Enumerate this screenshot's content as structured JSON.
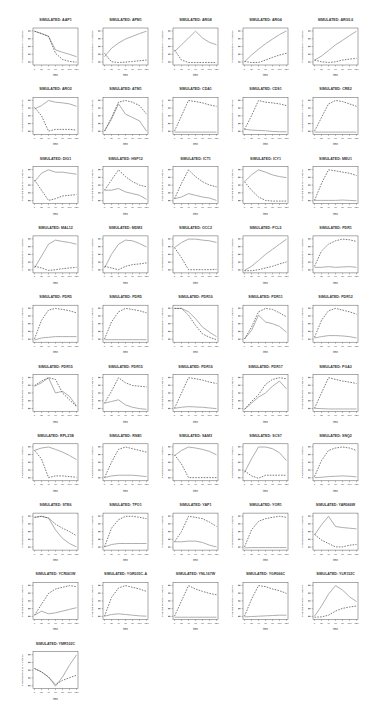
{
  "figure": {
    "columns": 5,
    "panel_pitch_x": 70,
    "panel_pitch_y": 69.3,
    "origin_x": 33,
    "origin_title_y": 21,
    "box_width": 45,
    "box_top_offset": 7,
    "box_height": 37,
    "line_color": "#999999",
    "dash_color": "#444444",
    "axis_color": "#555555"
  },
  "chart_data": {
    "type": "line",
    "title": "",
    "xlabel": "time",
    "ylabel": "Predicted Relative Abundance",
    "x": [
      0,
      20,
      40,
      60,
      80,
      100,
      120
    ],
    "x_tick_labels": [
      "0",
      "20",
      "40",
      "60",
      "80",
      "100",
      "120"
    ],
    "legend": {
      "solid": "series 1 (solid)",
      "dashed": "series 2 (dashed)"
    },
    "grid": false,
    "panels": [
      {
        "title": "SIMULATED: AAP1",
        "solid": [
          0.95,
          0.88,
          0.8,
          0.4,
          0.33,
          0.27,
          0.2
        ],
        "dashed": [
          0.95,
          0.88,
          0.8,
          0.3,
          0.12,
          0.06,
          0.04
        ]
      },
      {
        "title": "SIMULATED: APM1",
        "solid": [
          0.2,
          0.45,
          0.6,
          0.72,
          0.8,
          0.88,
          0.95
        ],
        "dashed": [
          0.3,
          0.05,
          0.03,
          0.04,
          0.06,
          0.08,
          0.1
        ]
      },
      {
        "title": "SIMULATED: ARG8",
        "solid": [
          0.35,
          0.55,
          0.75,
          0.95,
          0.75,
          0.62,
          0.55
        ],
        "dashed": [
          0.4,
          0.1,
          0.03,
          0.03,
          0.03,
          0.03,
          0.03
        ]
      },
      {
        "title": "SIMULATED: ARG4",
        "solid": [
          0.05,
          0.25,
          0.42,
          0.58,
          0.72,
          0.85,
          0.96
        ],
        "dashed": [
          0.06,
          0.03,
          0.03,
          0.1,
          0.18,
          0.25,
          0.3
        ]
      },
      {
        "title": "SIMULATED: ARG5,6",
        "solid": [
          0.1,
          0.22,
          0.38,
          0.55,
          0.68,
          0.82,
          0.95
        ],
        "dashed": [
          0.1,
          0.05,
          0.03,
          0.05,
          0.1,
          0.13,
          0.15
        ]
      },
      {
        "title": "SIMULATED: ARO2",
        "solid": [
          0.7,
          0.8,
          0.95,
          0.9,
          0.88,
          0.85,
          0.78
        ],
        "dashed": [
          0.75,
          0.5,
          0.05,
          0.1,
          0.1,
          0.1,
          0.08
        ]
      },
      {
        "title": "SIMULATED: ATM1",
        "solid": [
          0.05,
          0.4,
          0.85,
          0.55,
          0.45,
          0.35,
          0.05
        ],
        "dashed": [
          0.05,
          0.45,
          0.9,
          0.95,
          0.9,
          0.8,
          0.55
        ]
      },
      {
        "title": "SIMULATED: CDA1",
        "solid": [
          0.02,
          0.02,
          0.02,
          0.02,
          0.02,
          0.02,
          0.02
        ],
        "dashed": [
          0.05,
          0.5,
          0.95,
          0.92,
          0.88,
          0.82,
          0.78
        ]
      },
      {
        "title": "SIMULATED: CDS1",
        "solid": [
          0.1,
          0.08,
          0.07,
          0.06,
          0.04,
          0.03,
          0.03
        ],
        "dashed": [
          0.1,
          0.5,
          0.95,
          0.9,
          0.88,
          0.85,
          0.8
        ]
      },
      {
        "title": "SIMULATED: CRE2",
        "solid": [
          0.02,
          0.02,
          0.02,
          0.02,
          0.02,
          0.02,
          0.02
        ],
        "dashed": [
          0.05,
          0.45,
          0.85,
          0.95,
          0.92,
          0.85,
          0.78
        ]
      },
      {
        "title": "SIMULATED: DIG1",
        "solid": [
          0.6,
          0.85,
          0.95,
          0.88,
          0.88,
          0.85,
          0.82
        ],
        "dashed": [
          0.65,
          0.35,
          0.05,
          0.1,
          0.18,
          0.2,
          0.22
        ]
      },
      {
        "title": "SIMULATED: HSP12",
        "solid": [
          0.35,
          0.35,
          0.4,
          0.3,
          0.25,
          0.2,
          0.08
        ],
        "dashed": [
          0.35,
          0.65,
          0.95,
          0.75,
          0.6,
          0.5,
          0.45
        ]
      },
      {
        "title": "SIMULATED: ICT1",
        "solid": [
          0.1,
          0.15,
          0.25,
          0.2,
          0.15,
          0.12,
          0.05
        ],
        "dashed": [
          0.1,
          0.55,
          0.95,
          0.75,
          0.6,
          0.5,
          0.45
        ]
      },
      {
        "title": "SIMULATED: ICY1",
        "solid": [
          0.6,
          0.8,
          0.95,
          0.88,
          0.8,
          0.75,
          0.72
        ],
        "dashed": [
          0.6,
          0.35,
          0.15,
          0.05,
          0.03,
          0.03,
          0.03
        ]
      },
      {
        "title": "SIMULATED: MEU1",
        "solid": [
          0.05,
          0.05,
          0.05,
          0.05,
          0.06,
          0.05,
          0.04
        ],
        "dashed": [
          0.05,
          0.55,
          0.95,
          0.92,
          0.88,
          0.85,
          0.78
        ]
      },
      {
        "title": "SIMULATED: MAL12",
        "solid": [
          0.1,
          0.45,
          0.8,
          0.92,
          0.88,
          0.85,
          0.8
        ],
        "dashed": [
          0.15,
          0.1,
          0.03,
          0.05,
          0.08,
          0.1,
          0.12
        ]
      },
      {
        "title": "SIMULATED: MDM3",
        "solid": [
          0.1,
          0.5,
          0.8,
          0.92,
          0.9,
          0.82,
          0.72
        ],
        "dashed": [
          0.15,
          0.1,
          0.05,
          0.15,
          0.2,
          0.22,
          0.25
        ]
      },
      {
        "title": "SIMULATED: OCC2",
        "solid": [
          0.7,
          0.85,
          0.95,
          0.95,
          0.92,
          0.9,
          0.85
        ],
        "dashed": [
          0.7,
          0.4,
          0.05,
          0.05,
          0.05,
          0.05,
          0.06
        ]
      },
      {
        "title": "SIMULATED: PCL5",
        "solid": [
          0.03,
          0.15,
          0.32,
          0.5,
          0.65,
          0.8,
          0.95
        ],
        "dashed": [
          0.02,
          0.02,
          0.05,
          0.1,
          0.15,
          0.22,
          0.28
        ]
      },
      {
        "title": "SIMULATED: PDR1",
        "solid": [
          0.12,
          0.12,
          0.14,
          0.12,
          0.13,
          0.14,
          0.12
        ],
        "dashed": [
          0.15,
          0.6,
          0.8,
          0.9,
          0.95,
          0.93,
          0.88
        ]
      },
      {
        "title": "SIMULATED: PDR5",
        "solid": [
          0.02,
          0.08,
          0.1,
          0.12,
          0.12,
          0.12,
          0.12
        ],
        "dashed": [
          0.05,
          0.6,
          0.9,
          0.95,
          0.92,
          0.88,
          0.82
        ]
      },
      {
        "title": "SIMULATED: PDR5",
        "solid": [
          0.03,
          0.03,
          0.03,
          0.03,
          0.03,
          0.03,
          0.03
        ],
        "dashed": [
          0.05,
          0.55,
          0.85,
          0.95,
          0.92,
          0.88,
          0.82
        ]
      },
      {
        "title": "SIMULATED: PDR10",
        "solid": [
          0.95,
          0.95,
          0.85,
          0.65,
          0.4,
          0.25,
          0.12
        ],
        "dashed": [
          0.95,
          0.95,
          0.75,
          0.45,
          0.2,
          0.1,
          0.03
        ]
      },
      {
        "title": "SIMULATED: PDR11",
        "solid": [
          0.05,
          0.3,
          0.75,
          0.55,
          0.5,
          0.42,
          0.25
        ],
        "dashed": [
          0.05,
          0.4,
          0.85,
          0.95,
          0.92,
          0.82,
          0.7
        ]
      },
      {
        "title": "SIMULATED: PDR12",
        "solid": [
          0.08,
          0.12,
          0.15,
          0.15,
          0.14,
          0.12,
          0.08
        ],
        "dashed": [
          0.1,
          0.6,
          0.88,
          0.95,
          0.9,
          0.85,
          0.78
        ]
      },
      {
        "title": "SIMULATED: PDR15",
        "solid": [
          0.7,
          0.8,
          0.95,
          0.5,
          0.55,
          0.4,
          0.12
        ],
        "dashed": [
          0.72,
          0.85,
          0.95,
          0.9,
          0.5,
          0.3,
          0.1
        ]
      },
      {
        "title": "SIMULATED: PDR15",
        "solid": [
          0.2,
          0.25,
          0.3,
          0.15,
          0.08,
          0.04,
          0.02
        ],
        "dashed": [
          0.2,
          0.55,
          0.95,
          0.8,
          0.72,
          0.7,
          0.68
        ]
      },
      {
        "title": "SIMULATED: PDR16",
        "solid": [
          0.05,
          0.08,
          0.1,
          0.09,
          0.08,
          0.06,
          0.04
        ],
        "dashed": [
          0.05,
          0.5,
          0.95,
          0.92,
          0.88,
          0.82,
          0.78
        ]
      },
      {
        "title": "SIMULATED: PDR17",
        "solid": [
          0.02,
          0.2,
          0.38,
          0.5,
          0.7,
          0.85,
          0.62
        ],
        "dashed": [
          0.02,
          0.25,
          0.45,
          0.75,
          0.9,
          0.95,
          0.92
        ]
      },
      {
        "title": "SIMULATED: PGA3",
        "solid": [
          0.05,
          0.04,
          0.03,
          0.03,
          0.03,
          0.03,
          0.03
        ],
        "dashed": [
          0.05,
          0.5,
          0.95,
          0.9,
          0.85,
          0.82,
          0.78
        ]
      },
      {
        "title": "SIMULATED: RPL21B",
        "solid": [
          0.85,
          0.92,
          0.95,
          0.88,
          0.8,
          0.7,
          0.58
        ],
        "dashed": [
          0.85,
          0.6,
          0.05,
          0.1,
          0.1,
          0.08,
          0.06
        ]
      },
      {
        "title": "SIMULATED: RSB1",
        "solid": [
          0.05,
          0.1,
          0.12,
          0.12,
          0.12,
          0.1,
          0.08
        ],
        "dashed": [
          0.05,
          0.5,
          0.88,
          0.95,
          0.9,
          0.85,
          0.8
        ]
      },
      {
        "title": "SIMULATED: SAM3",
        "solid": [
          0.7,
          0.85,
          0.95,
          0.92,
          0.88,
          0.82,
          0.72
        ],
        "dashed": [
          0.72,
          0.45,
          0.05,
          0.05,
          0.05,
          0.05,
          0.05
        ]
      },
      {
        "title": "SIMULATED: SCS7",
        "solid": [
          0.2,
          0.6,
          0.95,
          0.95,
          0.9,
          0.78,
          0.55
        ],
        "dashed": [
          0.25,
          0.1,
          0.03,
          0.12,
          0.12,
          0.12,
          0.12
        ]
      },
      {
        "title": "SIMULATED: SNQ2",
        "solid": [
          0.05,
          0.06,
          0.08,
          0.09,
          0.1,
          0.09,
          0.07
        ],
        "dashed": [
          0.08,
          0.55,
          0.85,
          0.92,
          0.95,
          0.92,
          0.85
        ]
      },
      {
        "title": "SIMULATED: STE6",
        "solid": [
          0.92,
          0.95,
          0.9,
          0.55,
          0.3,
          0.15,
          0.05
        ],
        "dashed": [
          0.92,
          0.95,
          0.9,
          0.72,
          0.6,
          0.5,
          0.38
        ]
      },
      {
        "title": "SIMULATED: TPO1",
        "solid": [
          0.05,
          0.12,
          0.15,
          0.15,
          0.15,
          0.15,
          0.15
        ],
        "dashed": [
          0.05,
          0.6,
          0.85,
          0.95,
          0.95,
          0.92,
          0.88
        ]
      },
      {
        "title": "SIMULATED: YAP1",
        "solid": [
          0.2,
          0.2,
          0.22,
          0.22,
          0.18,
          0.1,
          0.05
        ],
        "dashed": [
          0.2,
          0.5,
          0.95,
          0.92,
          0.88,
          0.78,
          0.65
        ]
      },
      {
        "title": "SIMULATED: YOR1",
        "solid": [
          0.02,
          0.03,
          0.03,
          0.03,
          0.03,
          0.03,
          0.03
        ],
        "dashed": [
          0.05,
          0.55,
          0.8,
          0.88,
          0.92,
          0.95,
          0.92
        ]
      },
      {
        "title": "SIMULATED: YAR066W",
        "solid": [
          0.4,
          0.7,
          0.95,
          0.65,
          0.62,
          0.6,
          0.58
        ],
        "dashed": [
          0.42,
          0.25,
          0.15,
          0.05,
          0.05,
          0.1,
          0.12
        ]
      },
      {
        "title": "SIMULATED: YCR061W",
        "solid": [
          0.08,
          0.2,
          0.12,
          0.15,
          0.2,
          0.25,
          0.3
        ],
        "dashed": [
          0.08,
          0.4,
          0.72,
          0.85,
          0.9,
          0.95,
          0.92
        ]
      },
      {
        "title": "SIMULATED: YGR035C-A",
        "solid": [
          0.05,
          0.1,
          0.12,
          0.1,
          0.08,
          0.06,
          0.05
        ],
        "dashed": [
          0.05,
          0.6,
          0.88,
          0.95,
          0.9,
          0.85,
          0.78
        ]
      },
      {
        "title": "SIMULATED: YNL167W",
        "solid": [
          0.02,
          0.02,
          0.02,
          0.02,
          0.02,
          0.02,
          0.02
        ],
        "dashed": [
          0.05,
          0.5,
          0.95,
          0.85,
          0.78,
          0.72,
          0.68
        ]
      },
      {
        "title": "SIMULATED: YGR066C",
        "solid": [
          0.03,
          0.04,
          0.05,
          0.06,
          0.07,
          0.08,
          0.08
        ],
        "dashed": [
          0.05,
          0.55,
          0.95,
          0.92,
          0.85,
          0.8,
          0.72
        ]
      },
      {
        "title": "SIMULATED: YLR152C",
        "solid": [
          0.05,
          0.35,
          0.7,
          0.95,
          0.82,
          0.62,
          0.48
        ],
        "dashed": [
          0.02,
          0.03,
          0.08,
          0.2,
          0.28,
          0.32,
          0.35
        ]
      },
      {
        "title": "SIMULATED: YMR102C",
        "solid": [
          0.55,
          0.45,
          0.3,
          0.03,
          0.3,
          0.65,
          0.95
        ],
        "dashed": [
          0.55,
          0.45,
          0.3,
          0.08,
          0.2,
          0.28,
          0.35
        ]
      }
    ]
  }
}
